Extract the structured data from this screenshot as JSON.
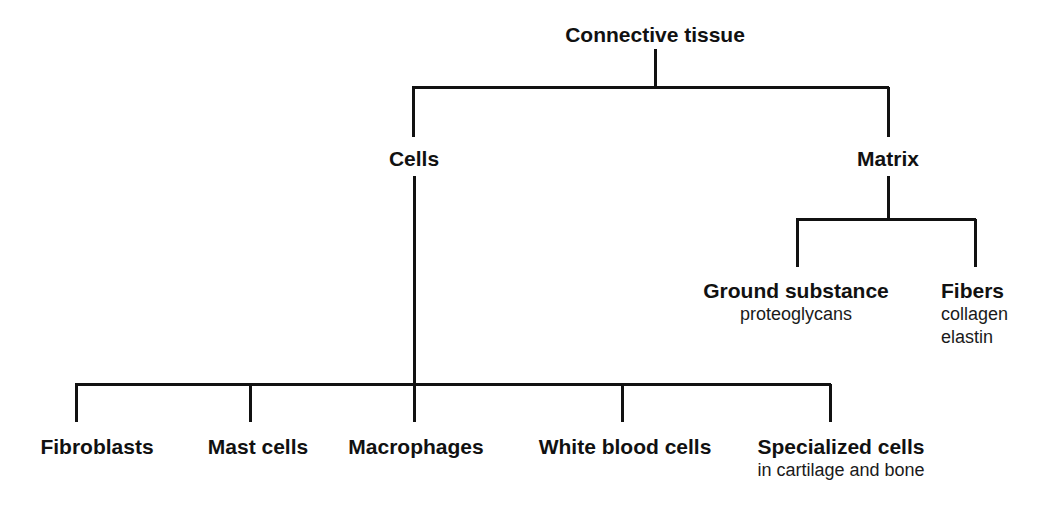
{
  "diagram": {
    "title": "Connective tissue",
    "type": "hierarchy-tree",
    "line_color": "#111111",
    "text_color": "#111111",
    "background_color": "#ffffff",
    "root": {
      "label": "Connective tissue",
      "level": 0
    },
    "level1": [
      {
        "label": "Cells",
        "level": 1
      },
      {
        "label": "Matrix",
        "level": 1
      }
    ],
    "matrix_children": [
      {
        "label": "Ground substance",
        "sublabels": [
          "proteoglycans"
        ]
      },
      {
        "label": "Fibers",
        "sublabels": [
          "collagen",
          "elastin"
        ]
      }
    ],
    "cells_children": [
      {
        "label": "Fibroblasts",
        "sublabels": []
      },
      {
        "label": "Mast cells",
        "sublabels": []
      },
      {
        "label": "Macrophages",
        "sublabels": []
      },
      {
        "label": "White blood cells",
        "sublabels": []
      },
      {
        "label": "Specialized cells",
        "sublabels": [
          "in cartilage and bone"
        ]
      }
    ]
  }
}
